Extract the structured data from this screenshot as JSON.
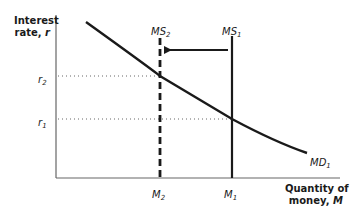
{
  "y_axis": {
    "title_line1": "Interest",
    "title_line2": "rate, ",
    "title_var": "r"
  },
  "x_axis": {
    "title_line1": "Quantity of",
    "title_line2": "money, ",
    "title_var": "M"
  },
  "y_ticks": [
    {
      "base": "r",
      "sub": "2"
    },
    {
      "base": "r",
      "sub": "1"
    }
  ],
  "x_ticks": [
    {
      "base": "M",
      "sub": "2"
    },
    {
      "base": "M",
      "sub": "1"
    }
  ],
  "curves": {
    "md": {
      "base": "MD",
      "sub": "1"
    },
    "ms1": {
      "base": "MS",
      "sub": "1"
    },
    "ms2": {
      "base": "MS",
      "sub": "2"
    }
  },
  "colors": {
    "ink": "#1a1a1a",
    "axis": "#555555",
    "dots": "#666666"
  }
}
